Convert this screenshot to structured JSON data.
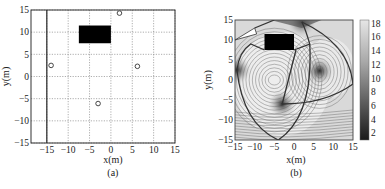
{
  "chart_data": [
    {
      "type": "scatter",
      "panel_label": "(a)",
      "xlabel": "x(m)",
      "ylabel": "y(m)",
      "xlim": [
        -18.7,
        15
      ],
      "ylim": [
        -15,
        15
      ],
      "xticks": [
        -15,
        -10,
        -5,
        0,
        5,
        10,
        15
      ],
      "yticks": [
        -15,
        -10,
        -5,
        0,
        5,
        10,
        15
      ],
      "grid": true,
      "grid_style": "dotted",
      "boundary_line_x": -15,
      "obstacle": {
        "x0": -7.5,
        "x1": 0,
        "y0": 7.5,
        "y1": 11.5,
        "color": "#000000"
      },
      "points": [
        {
          "x": -14,
          "y": 2.5
        },
        {
          "x": 2,
          "y": 14.3
        },
        {
          "x": 6.2,
          "y": 2.3
        },
        {
          "x": -3,
          "y": -6.1
        }
      ],
      "marker": "open-circle"
    },
    {
      "type": "heatmap",
      "subtype": "contour",
      "panel_label": "(b)",
      "xlabel": "x(m)",
      "ylabel": "y(m)",
      "xlim": [
        -15,
        15
      ],
      "ylim": [
        -15,
        15
      ],
      "xticks": [
        -15,
        -10,
        -5,
        0,
        5,
        10,
        15
      ],
      "yticks": [
        -15,
        -10,
        -5,
        0,
        5,
        10,
        15
      ],
      "colorbar": {
        "min": 1,
        "max": 18.5,
        "ticks": [
          2,
          4,
          6,
          8,
          10,
          12,
          14,
          16,
          18
        ],
        "colormap": "gray"
      },
      "obstacle": {
        "x0": -7.5,
        "x1": 0,
        "y0": 7.5,
        "y1": 11.5,
        "color": "#000000"
      },
      "anchors": [
        {
          "x": -14.5,
          "y": 2.5
        },
        {
          "x": 2,
          "y": 14.5
        },
        {
          "x": 6.5,
          "y": 2.3
        },
        {
          "x": -3,
          "y": -6
        }
      ]
    }
  ],
  "panels": {
    "a": {
      "caption": "(a)",
      "xlabel": "x(m)",
      "ylabel": "y(m)"
    },
    "b": {
      "caption": "(b)",
      "xlabel": "x(m)",
      "ylabel": "y(m)"
    }
  }
}
